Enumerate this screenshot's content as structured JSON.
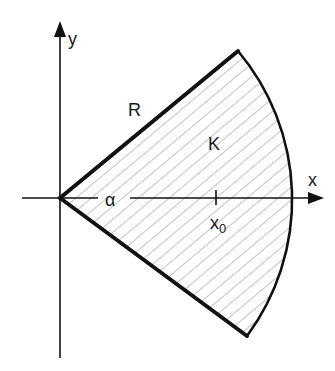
{
  "figure": {
    "type": "circular-sector-diagram",
    "labels": {
      "y_axis": "y",
      "x_axis": "x",
      "radius": "R",
      "region": "K",
      "angle": "α",
      "point_main": "x",
      "point_sub": "0"
    },
    "colors": {
      "stroke": "#111111",
      "hatch": "#8a8a8a",
      "background": "#ffffff"
    }
  }
}
